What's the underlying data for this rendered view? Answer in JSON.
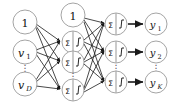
{
  "diagram": {
    "type": "neural-network-diagram",
    "background": "#ffffff",
    "node_stroke": "#9a9a9a",
    "edge_color": "#1a1a1a",
    "text_color": "#111111",
    "layers": [
      {
        "name": "input-layer",
        "x": 25,
        "nodes": [
          {
            "id": "in-bias",
            "label": "1",
            "kind": "bias",
            "cy": 22,
            "r": 12
          },
          {
            "id": "in-v1",
            "label": "v",
            "sub": "1",
            "kind": "input",
            "cy": 52,
            "r": 12
          },
          {
            "id": "in-ellipsis",
            "label": "⋮",
            "kind": "ellipsis",
            "cy": 68
          },
          {
            "id": "in-vD",
            "label": "v",
            "sub": "D",
            "kind": "input",
            "cy": 84,
            "r": 12
          }
        ]
      },
      {
        "name": "hidden-layer",
        "x": 73,
        "nodes": [
          {
            "id": "hid-bias",
            "label": "1",
            "kind": "bias",
            "cy": 15,
            "r": 12
          },
          {
            "id": "hid-n1",
            "label": "Σ",
            "label2": "f()",
            "kind": "neuron",
            "cy": 42,
            "r": 11
          },
          {
            "id": "hid-n2",
            "label": "Σ",
            "label2": "f()",
            "kind": "neuron",
            "cy": 62,
            "r": 11
          },
          {
            "id": "hid-ellipsis",
            "label": "⋮",
            "kind": "ellipsis",
            "cy": 76
          },
          {
            "id": "hid-n3",
            "label": "Σ",
            "label2": "f()",
            "kind": "neuron",
            "cy": 90,
            "r": 11
          }
        ]
      },
      {
        "name": "output-neuron-layer",
        "x": 116,
        "nodes": [
          {
            "id": "out-n1",
            "label": "Σ",
            "label2": "f()",
            "kind": "neuron",
            "cy": 24,
            "r": 11
          },
          {
            "id": "out-n2",
            "label": "Σ",
            "label2": "f()",
            "kind": "neuron",
            "cy": 52,
            "r": 11
          },
          {
            "id": "out-ellipsis",
            "label": "⋮",
            "kind": "ellipsis",
            "cy": 67
          },
          {
            "id": "out-n3",
            "label": "Σ",
            "label2": "f()",
            "kind": "neuron",
            "cy": 82,
            "r": 11
          }
        ]
      },
      {
        "name": "output-value-layer",
        "x": 156,
        "nodes": [
          {
            "id": "y1",
            "label": "y",
            "sub": "1",
            "kind": "output",
            "cy": 24,
            "r": 11
          },
          {
            "id": "y2",
            "label": "y",
            "sub": "2",
            "kind": "output",
            "cy": 52,
            "r": 11
          },
          {
            "id": "y-ellipsis",
            "label": "⋮",
            "kind": "ellipsis",
            "cy": 67
          },
          {
            "id": "yK",
            "label": "y",
            "sub": "K",
            "kind": "output",
            "cy": 82,
            "r": 11
          }
        ]
      }
    ],
    "labels": {
      "bias": "1",
      "sum_symbol": "Σ",
      "activation": "f()",
      "input_symbol": "v",
      "output_symbol": "y",
      "input_first_sub": "1",
      "input_last_sub": "D",
      "output_first_sub": "1",
      "output_second_sub": "2",
      "output_last_sub": "K",
      "ellipsis": "⋮"
    }
  }
}
